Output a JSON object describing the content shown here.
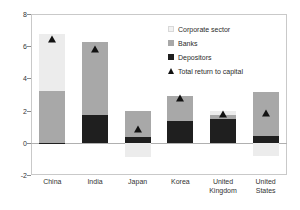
{
  "chart_data": {
    "type": "bar",
    "subtype": "stacked-bar-with-markers",
    "title": "",
    "xlabel": "",
    "ylabel": "",
    "ylim": [
      -2,
      8
    ],
    "yticks": [
      -2,
      0,
      2,
      4,
      6,
      8
    ],
    "ytick_labels": [
      "-2",
      "0",
      "2",
      "4",
      "6",
      "8"
    ],
    "grid": false,
    "legend_position": "upper-right-inside",
    "categories": [
      "China",
      "India",
      "Japan",
      "Korea",
      "United Kingdom",
      "United States"
    ],
    "series": [
      {
        "name": "Corporate sector",
        "type": "bar-segment",
        "color": "#ececec",
        "values": [
          3.55,
          0.0,
          -0.9,
          0.0,
          0.25,
          -0.85
        ]
      },
      {
        "name": "Banks",
        "type": "bar-segment",
        "color": "#a8a8a8",
        "values": [
          3.2,
          4.5,
          1.6,
          1.55,
          0.3,
          2.7
        ]
      },
      {
        "name": "Depositors",
        "type": "bar-segment",
        "color": "#1f1f1f",
        "values": [
          -0.05,
          1.75,
          0.35,
          1.35,
          1.45,
          0.45
        ]
      },
      {
        "name": "Total return to capital",
        "type": "marker",
        "marker": "triangle-up",
        "color": "#121212",
        "values": [
          6.65,
          6.05,
          1.05,
          3.0,
          2.0,
          2.05
        ]
      }
    ]
  },
  "legend": {
    "items": [
      {
        "label": "Corporate sector",
        "swatch": "square-light-gray"
      },
      {
        "label": "Banks",
        "swatch": "square-medium-gray"
      },
      {
        "label": "Depositors",
        "swatch": "square-black"
      },
      {
        "label": "Total return to capital",
        "swatch": "triangle-up-black"
      }
    ]
  },
  "x_axis": {
    "labels": [
      "China",
      "India",
      "Japan",
      "Korea",
      "United\nKingdom",
      "United\nStates"
    ]
  }
}
